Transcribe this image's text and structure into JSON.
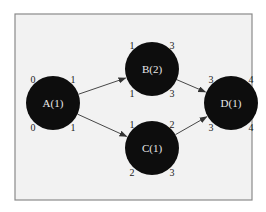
{
  "diagram": {
    "type": "activity-network",
    "nodes": [
      {
        "id": "A",
        "label": "A(1)",
        "top_left": "0",
        "top_right": "1",
        "bottom_left": "0",
        "bottom_right": "1"
      },
      {
        "id": "B",
        "label": "B(2)",
        "top_left": "1",
        "top_right": "3",
        "bottom_left": "1",
        "bottom_right": "3"
      },
      {
        "id": "C",
        "label": "C(1)",
        "top_left": "1",
        "top_right": "2",
        "bottom_left": "2",
        "bottom_right": "3"
      },
      {
        "id": "D",
        "label": "D(1)",
        "top_left": "3",
        "top_right": "4",
        "bottom_left": "3",
        "bottom_right": "4"
      }
    ],
    "edges": [
      {
        "from": "A",
        "to": "B"
      },
      {
        "from": "A",
        "to": "C"
      },
      {
        "from": "B",
        "to": "D"
      },
      {
        "from": "C",
        "to": "D"
      }
    ],
    "colors": {
      "node_fill": "#0d0d0d",
      "node_text": "#e8e8e8",
      "background": "#f2f2f2",
      "frame": "#8a8a8a"
    }
  }
}
